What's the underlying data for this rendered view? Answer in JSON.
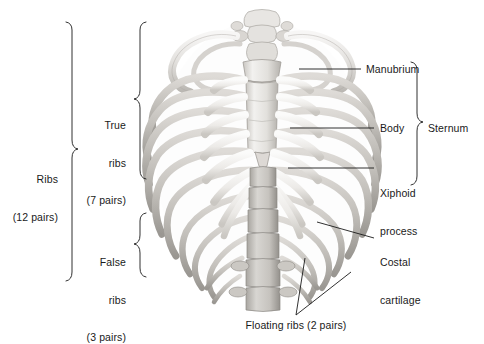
{
  "figure": {
    "background_color": "#ffffff",
    "line_color": "#1a1a1a",
    "bone_light": "#efeeec",
    "bone_mid": "#cfcdc9",
    "bone_dark": "#a8a5a0",
    "bone_shadow": "#8b8884"
  },
  "labels": {
    "ribs": {
      "line1": "Ribs",
      "line2": "(12 pairs)"
    },
    "true_ribs": {
      "line1": "True",
      "line2": "ribs",
      "line3": "(7 pairs)"
    },
    "false_ribs": {
      "line1": "False",
      "line2": "ribs",
      "line3": "(3 pairs)"
    },
    "manubrium": "Manubrium",
    "body": "Body",
    "xiphoid": {
      "line1": "Xiphoid",
      "line2": "process"
    },
    "sternum": "Sternum",
    "costal_cartilage": {
      "line1": "Costal",
      "line2": "cartilage"
    },
    "floating_ribs": "Floating ribs (2 pairs)"
  }
}
